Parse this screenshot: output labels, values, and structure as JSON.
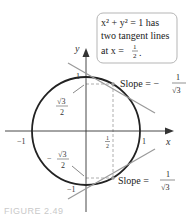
{
  "figure": {
    "caption": "FIGURE 2.49",
    "callout": {
      "line1": "x² + y² = 1 has",
      "line2": "two tangent lines",
      "line3_prefix": "at x = ",
      "line3_frac_num": "1",
      "line3_frac_den": "2",
      "line3_suffix": "."
    },
    "axes": {
      "x_label": "x",
      "y_label": "y",
      "tick_x_neg": "−1",
      "tick_x_pos": "1",
      "tick_y_pos": "1",
      "tick_y_neg": "−1",
      "half_num": "1",
      "half_den": "2"
    },
    "labels": {
      "upper_y_num": "√3",
      "upper_y_den": "2",
      "lower_y_sign": "−",
      "lower_y_num": "√3",
      "lower_y_den": "2",
      "upper_slope_prefix": "Slope = −",
      "upper_slope_num": "1",
      "upper_slope_den": "√3",
      "lower_slope_prefix": "Slope = ",
      "lower_slope_num": "1",
      "lower_slope_den": "√3"
    },
    "colors": {
      "circle": "#222222",
      "tangent": "#9a9a9a",
      "dashed": "#9a9a9a",
      "axis": "#333333",
      "box_border": "#b5b5b5"
    }
  }
}
